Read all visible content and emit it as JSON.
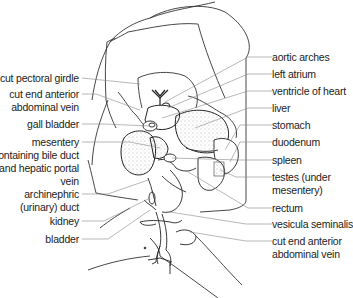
{
  "figure": {
    "line_color": "#333333",
    "leader_color": "#777777"
  },
  "labels_left": [
    {
      "id": "cut-pectoral-girdle",
      "lines": [
        "cut pectoral girdle"
      ]
    },
    {
      "id": "cut-end-anterior-abdominal-vein-left",
      "lines": [
        "cut end anterior",
        "abdominal vein"
      ]
    },
    {
      "id": "gall-bladder",
      "lines": [
        "gall bladder"
      ]
    },
    {
      "id": "mesentery",
      "lines": [
        "mesentery",
        "containing bile duct",
        "and hepatic portal",
        "vein"
      ]
    },
    {
      "id": "archinephric-duct",
      "lines": [
        "archinephric",
        "(urinary) duct"
      ]
    },
    {
      "id": "kidney",
      "lines": [
        "kidney"
      ]
    },
    {
      "id": "bladder",
      "lines": [
        "bladder"
      ]
    }
  ],
  "labels_right": [
    {
      "id": "aortic-arches",
      "lines": [
        "aortic arches"
      ]
    },
    {
      "id": "left-atrium",
      "lines": [
        "left atrium"
      ]
    },
    {
      "id": "ventricle-of-heart",
      "lines": [
        "ventricle of heart"
      ]
    },
    {
      "id": "liver",
      "lines": [
        "liver"
      ]
    },
    {
      "id": "stomach",
      "lines": [
        "stomach"
      ]
    },
    {
      "id": "duodenum",
      "lines": [
        "duodenum"
      ]
    },
    {
      "id": "spleen",
      "lines": [
        "spleen"
      ]
    },
    {
      "id": "testes",
      "lines": [
        "testes (under",
        "mesentery)"
      ]
    },
    {
      "id": "rectum",
      "lines": [
        "rectum"
      ]
    },
    {
      "id": "vesicula-seminalis",
      "lines": [
        "vesicula seminalis"
      ]
    },
    {
      "id": "cut-end-anterior-abdominal-vein-right",
      "lines": [
        "cut end anterior",
        "abdominal vein"
      ]
    }
  ]
}
